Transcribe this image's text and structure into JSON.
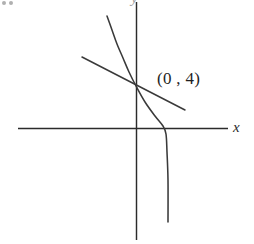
{
  "figure": {
    "caption_label": "(0 , 4)",
    "x_axis_label": "x",
    "y_axis_label": "y",
    "line_color": "#3a3a3a",
    "axis_color": "#2b2b2b",
    "background_color": "#ffffff"
  },
  "chart_data": {
    "type": "line",
    "title": "",
    "xlabel": "x",
    "ylabel": "y",
    "grid": false,
    "legend": null,
    "axes": {
      "x_axis_pixel_y": 128,
      "y_axis_pixel_x": 136,
      "x_axis_pixel_span": [
        18,
        228
      ],
      "y_axis_pixel_span": [
        2,
        240
      ]
    },
    "annotations": [
      {
        "text": "(0 , 4)",
        "describes": "point where the curve crosses the y-axis",
        "point": [
          0,
          4
        ]
      }
    ],
    "series": [
      {
        "name": "curve",
        "description": "decreasing curve passing through (0, 4), concave, steeply falling and crossing the x-axis to the right of the origin",
        "pixel_points": [
          [
            107,
            16
          ],
          [
            112,
            30
          ],
          [
            117,
            44
          ],
          [
            123,
            58
          ],
          [
            129,
            72
          ],
          [
            136,
            86
          ],
          [
            145,
            102
          ],
          [
            155,
            116
          ],
          [
            163,
            126
          ],
          [
            166,
            134
          ],
          [
            167,
            152
          ],
          [
            168,
            180
          ],
          [
            168,
            222
          ]
        ]
      },
      {
        "name": "tangent-line",
        "description": "straight tangent line touching the curve at (0, 4)",
        "pixel_points": [
          [
            82,
            57
          ],
          [
            185,
            110
          ]
        ]
      }
    ]
  }
}
